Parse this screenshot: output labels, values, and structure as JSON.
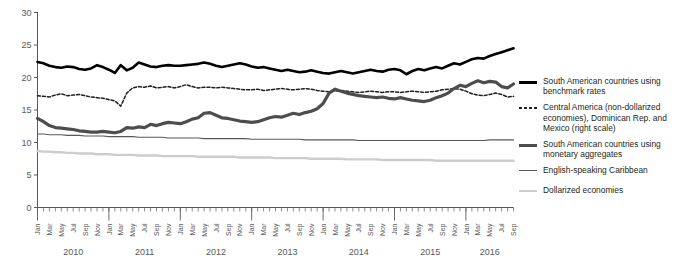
{
  "chart_data": {
    "type": "line",
    "title": "",
    "xlabel": "",
    "ylabel": "",
    "ylim": [
      0,
      30
    ],
    "yticks": [
      0,
      5,
      10,
      15,
      20,
      25,
      30
    ],
    "grid": false,
    "legend_position": "right",
    "x_start": "Jan 2010",
    "x_end": "Sep 2016",
    "years": [
      "2010",
      "2011",
      "2012",
      "2013",
      "2014",
      "2015",
      "2016"
    ],
    "months_labeled": [
      "Jan",
      "Mar",
      "May",
      "Jul",
      "Sep",
      "Nov"
    ],
    "months_per_year": [
      "Jan",
      "Feb",
      "Mar",
      "Apr",
      "May",
      "Jun",
      "Jul",
      "Aug",
      "Sep",
      "Oct",
      "Nov",
      "Dec"
    ],
    "n_points": 81,
    "series": [
      {
        "name": "South American countries using benchmark rates",
        "color": "#000000",
        "width": 2.6,
        "dash": "none",
        "values": [
          22.4,
          22.2,
          21.8,
          21.6,
          21.5,
          21.7,
          21.6,
          21.3,
          21.2,
          21.4,
          21.9,
          21.6,
          21.2,
          20.7,
          21.9,
          21.1,
          21.5,
          22.3,
          22.0,
          21.7,
          21.6,
          21.8,
          21.9,
          21.8,
          21.8,
          21.9,
          22.0,
          22.1,
          22.3,
          22.1,
          21.8,
          21.6,
          21.8,
          22.0,
          22.2,
          22.0,
          21.7,
          21.5,
          21.6,
          21.4,
          21.2,
          21.0,
          21.2,
          21.0,
          20.8,
          20.9,
          21.1,
          20.9,
          20.7,
          20.6,
          20.8,
          21.0,
          20.8,
          20.6,
          20.8,
          21.0,
          21.2,
          21.0,
          20.9,
          21.2,
          21.3,
          21.1,
          20.5,
          21.0,
          21.3,
          21.1,
          21.4,
          21.6,
          21.4,
          21.8,
          22.2,
          22.0,
          22.4,
          22.8,
          23.0,
          22.9,
          23.3,
          23.6,
          23.9,
          24.2,
          24.5
        ]
      },
      {
        "name": "Central America (non-dollarized economies), Dominican Rep. and Mexico (right scale)",
        "color": "#231f20",
        "width": 1.5,
        "dash": "3,2",
        "values": [
          17.2,
          17.1,
          17.0,
          17.3,
          17.5,
          17.2,
          17.3,
          17.4,
          17.2,
          17.0,
          16.9,
          16.8,
          16.6,
          16.4,
          15.6,
          17.6,
          18.4,
          18.6,
          18.5,
          18.7,
          18.4,
          18.5,
          18.6,
          18.4,
          18.6,
          18.9,
          18.6,
          18.4,
          18.5,
          18.5,
          18.4,
          18.5,
          18.4,
          18.3,
          18.2,
          18.1,
          18.1,
          18.2,
          18.0,
          18.1,
          18.2,
          18.3,
          18.2,
          18.1,
          18.2,
          18.3,
          18.2,
          18.0,
          17.9,
          17.8,
          17.9,
          18.0,
          17.9,
          17.8,
          17.7,
          17.8,
          17.9,
          17.8,
          17.7,
          17.8,
          17.8,
          17.7,
          17.8,
          17.9,
          17.8,
          17.7,
          17.8,
          17.9,
          18.1,
          18.2,
          18.3,
          18.2,
          17.9,
          17.5,
          17.3,
          17.2,
          17.4,
          17.6,
          17.4,
          17.0,
          17.1
        ]
      },
      {
        "name": "South American countries using monetary aggregates",
        "color": "#4d4d4d",
        "width": 3.2,
        "dash": "none",
        "values": [
          13.7,
          13.2,
          12.6,
          12.3,
          12.2,
          12.1,
          12.0,
          11.8,
          11.7,
          11.6,
          11.6,
          11.7,
          11.6,
          11.5,
          11.7,
          12.3,
          12.2,
          12.4,
          12.3,
          12.8,
          12.6,
          12.9,
          13.1,
          13.0,
          12.9,
          13.2,
          13.6,
          13.8,
          14.5,
          14.6,
          14.2,
          13.8,
          13.7,
          13.5,
          13.3,
          13.2,
          13.1,
          13.2,
          13.5,
          13.8,
          14.0,
          13.9,
          14.2,
          14.5,
          14.3,
          14.6,
          14.8,
          15.2,
          16.0,
          17.6,
          18.2,
          17.9,
          17.6,
          17.4,
          17.2,
          17.1,
          17.0,
          16.9,
          17.0,
          16.8,
          16.7,
          16.9,
          16.7,
          16.5,
          16.4,
          16.3,
          16.5,
          16.9,
          17.2,
          17.6,
          18.3,
          18.8,
          18.6,
          19.1,
          19.5,
          19.2,
          19.4,
          19.3,
          18.6,
          18.4,
          19.0
        ]
      },
      {
        "name": "English-speaking Caribbean",
        "color": "#58595b",
        "width": 1.1,
        "dash": "none",
        "values": [
          11.3,
          11.3,
          11.2,
          11.2,
          11.2,
          11.1,
          11.1,
          11.1,
          11.0,
          11.0,
          11.0,
          11.0,
          10.9,
          10.9,
          10.9,
          10.9,
          10.9,
          10.8,
          10.8,
          10.8,
          10.8,
          10.8,
          10.7,
          10.7,
          10.7,
          10.7,
          10.7,
          10.7,
          10.6,
          10.6,
          10.6,
          10.6,
          10.6,
          10.6,
          10.6,
          10.6,
          10.5,
          10.5,
          10.5,
          10.5,
          10.5,
          10.5,
          10.5,
          10.5,
          10.5,
          10.4,
          10.4,
          10.4,
          10.4,
          10.4,
          10.4,
          10.4,
          10.4,
          10.4,
          10.3,
          10.3,
          10.3,
          10.3,
          10.3,
          10.3,
          10.3,
          10.3,
          10.3,
          10.3,
          10.3,
          10.3,
          10.3,
          10.3,
          10.3,
          10.3,
          10.3,
          10.3,
          10.3,
          10.3,
          10.3,
          10.3,
          10.4,
          10.4,
          10.4,
          10.4,
          10.4
        ]
      },
      {
        "name": "Dollarized economies",
        "color": "#cdcdcd",
        "width": 2.4,
        "dash": "none",
        "values": [
          8.7,
          8.6,
          8.6,
          8.5,
          8.5,
          8.4,
          8.4,
          8.3,
          8.3,
          8.3,
          8.2,
          8.2,
          8.2,
          8.1,
          8.1,
          8.1,
          8.1,
          8.0,
          8.0,
          8.0,
          8.0,
          7.9,
          7.9,
          7.9,
          7.9,
          7.9,
          7.9,
          7.8,
          7.8,
          7.8,
          7.8,
          7.8,
          7.8,
          7.8,
          7.7,
          7.7,
          7.7,
          7.7,
          7.7,
          7.7,
          7.6,
          7.6,
          7.6,
          7.6,
          7.6,
          7.6,
          7.5,
          7.5,
          7.5,
          7.5,
          7.5,
          7.5,
          7.4,
          7.4,
          7.4,
          7.4,
          7.4,
          7.4,
          7.3,
          7.3,
          7.3,
          7.3,
          7.3,
          7.3,
          7.3,
          7.3,
          7.3,
          7.2,
          7.2,
          7.2,
          7.2,
          7.2,
          7.2,
          7.2,
          7.2,
          7.2,
          7.2,
          7.2,
          7.2,
          7.2,
          7.2
        ]
      }
    ]
  },
  "legend": {
    "items": [
      {
        "label": "South American countries using benchmark rates",
        "style": "thick-solid-black"
      },
      {
        "label": "Central America (non-dollarized economies), Dominican Rep. and Mexico (right scale)",
        "style": "dashed-black"
      },
      {
        "label": "South American countries using monetary aggregates",
        "style": "thick-solid-gray"
      },
      {
        "label": "English-speaking Caribbean",
        "style": "thin-solid-darkgray"
      },
      {
        "label": "Dollarized economies",
        "style": "thin-solid-lightgray"
      }
    ]
  }
}
